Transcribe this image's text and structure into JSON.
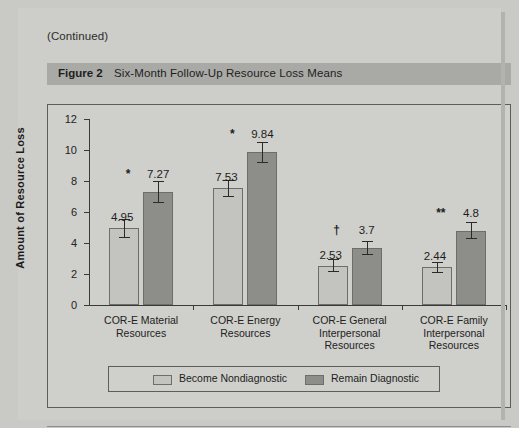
{
  "page": {
    "continued_note": "(Continued)"
  },
  "figure": {
    "number_label": "Figure 2",
    "title": "Six-Month Follow-Up Resource Loss Means"
  },
  "legend": {
    "items": [
      {
        "label": "Become Nondiagnostic",
        "color": "#c3c3bf"
      },
      {
        "label": "Remain Diagnostic",
        "color": "#8d8d8a"
      }
    ]
  },
  "chart_data": {
    "type": "bar",
    "title": "Six-Month Follow-Up Resource Loss Means",
    "xlabel": "Type of Resource",
    "ylabel": "Amount of Resource Loss",
    "ylim": [
      0,
      12
    ],
    "yticks": [
      0,
      2,
      4,
      6,
      8,
      10,
      12
    ],
    "ytick_labels": [
      "0",
      "2",
      "4",
      "6",
      "8",
      "10",
      "12"
    ],
    "grid": false,
    "legend_position": "bottom",
    "categories": [
      "COR-E Material Resources",
      "COR-E Energy Resources",
      "COR-E General Interpersonal Resources",
      "COR-E Family Interpersonal Resources"
    ],
    "category_lines": [
      [
        "COR-E Material",
        "Resources"
      ],
      [
        "COR-E Energy",
        "Resources"
      ],
      [
        "COR-E General",
        "Interpersonal",
        "Resources"
      ],
      [
        "COR-E Family",
        "Interpersonal",
        "Resources"
      ]
    ],
    "series": [
      {
        "name": "Become Nondiagnostic",
        "color": "#c3c3bf",
        "values": [
          4.95,
          7.53,
          2.53,
          2.44
        ],
        "value_labels": [
          "4.95",
          "7.53",
          "2.53",
          "2.44"
        ],
        "errors": [
          0.62,
          0.55,
          0.42,
          0.35
        ],
        "significance": [
          "*",
          "*",
          "†",
          "**"
        ]
      },
      {
        "name": "Remain Diagnostic",
        "color": "#8d8d8a",
        "values": [
          7.27,
          9.84,
          3.7,
          4.8
        ],
        "value_labels": [
          "7.27",
          "9.84",
          "3.7",
          "4.8"
        ],
        "errors": [
          0.72,
          0.68,
          0.45,
          0.55
        ],
        "significance": [
          "",
          "",
          "",
          ""
        ]
      }
    ]
  }
}
